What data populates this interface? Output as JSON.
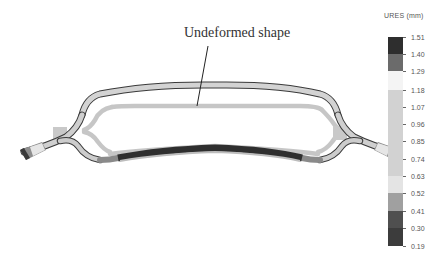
{
  "annotation": {
    "label": "Undeformed shape"
  },
  "legend": {
    "title": "URES (mm)",
    "ticks": [
      "1.51",
      "1.40",
      "1.29",
      "1.18",
      "1.07",
      "0.96",
      "0.85",
      "0.74",
      "0.63",
      "0.52",
      "0.41",
      "0.30",
      "0.19"
    ],
    "bands": [
      {
        "from": "1.51",
        "to": "1.40",
        "color": "#2e2e2e"
      },
      {
        "from": "1.40",
        "to": "1.29",
        "color": "#6b6b6b"
      },
      {
        "from": "1.29",
        "to": "1.18",
        "color": "#f4f4f4"
      },
      {
        "from": "1.18",
        "to": "0.63",
        "color": "#d2d2d2"
      },
      {
        "from": "0.63",
        "to": "0.52",
        "color": "#e4e4e4"
      },
      {
        "from": "0.52",
        "to": "0.41",
        "color": "#a0a0a0"
      },
      {
        "from": "0.41",
        "to": "0.30",
        "color": "#4f4f4f"
      },
      {
        "from": "0.30",
        "to": "0.19",
        "color": "#3c3c3c"
      }
    ]
  },
  "colors": {
    "undeformed": "#c8c8c8",
    "deformed_light": "#d0d0d0",
    "deformed_dark": "#2e2e2e",
    "outline": "#3a3a3a"
  }
}
